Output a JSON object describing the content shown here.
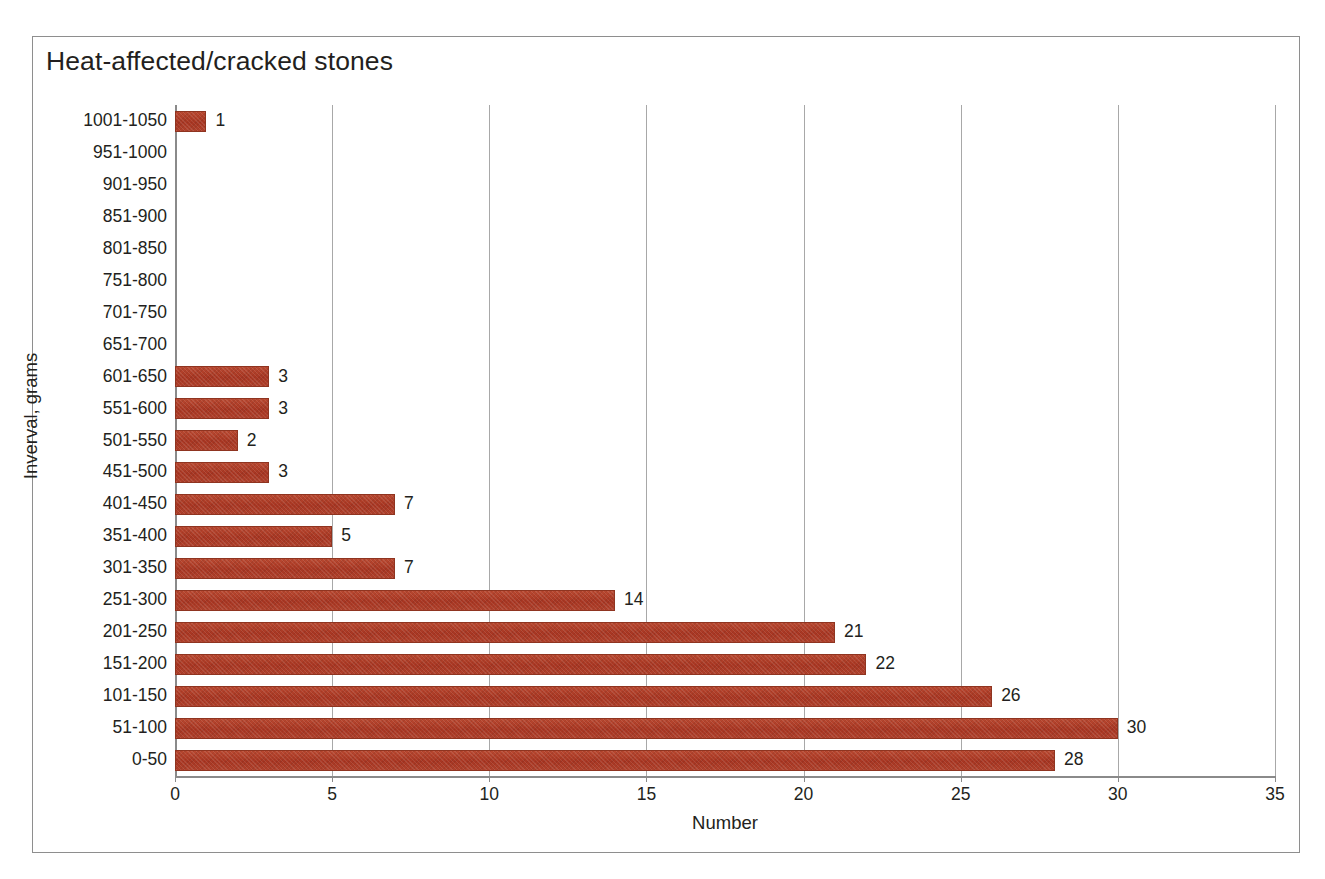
{
  "chart_data": {
    "type": "bar",
    "orientation": "horizontal",
    "title": "Heat-affected/cracked stones",
    "xlabel": "Number",
    "ylabel": "Inverval, grams",
    "xlim": [
      0,
      35
    ],
    "xticks": [
      0,
      5,
      10,
      15,
      20,
      25,
      30,
      35
    ],
    "grid": "vertical",
    "legend": "none",
    "bar_color": "#ab3a26",
    "categories": [
      "1001-1050",
      "951-1000",
      "901-950",
      "851-900",
      "801-850",
      "751-800",
      "701-750",
      "651-700",
      "601-650",
      "551-600",
      "501-550",
      "451-500",
      "401-450",
      "351-400",
      "301-350",
      "251-300",
      "201-250",
      "151-200",
      "101-150",
      "51-100",
      "0-50"
    ],
    "values": [
      1,
      0,
      0,
      0,
      0,
      0,
      0,
      0,
      3,
      3,
      2,
      3,
      7,
      5,
      7,
      14,
      21,
      22,
      26,
      30,
      28
    ],
    "value_labels": [
      "1",
      "",
      "",
      "",
      "",
      "",
      "",
      "",
      "3",
      "3",
      "2",
      "3",
      "7",
      "5",
      "7",
      "14",
      "21",
      "22",
      "26",
      "30",
      "28"
    ]
  }
}
